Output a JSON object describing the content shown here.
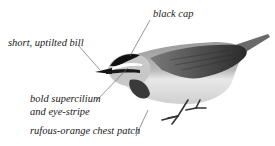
{
  "diagram": {
    "annotations": [
      {
        "id": "black-cap",
        "text": "black cap"
      },
      {
        "id": "bill",
        "text": "short, uptilted bill"
      },
      {
        "id": "supercilium",
        "line1": "bold supercilium",
        "line2": "and eye-stripe"
      },
      {
        "id": "chest",
        "text": "rufous-orange chest patch"
      }
    ],
    "colors": {
      "background": "#ffffff",
      "text": "#1a1a1a",
      "leader_line": "#6a6a6a",
      "cap": "#111111",
      "back": "#8a8a8a",
      "wing": "#4a4a4a",
      "underparts": "#e6e6e6",
      "chest_patch": "#5a5a5a"
    }
  }
}
